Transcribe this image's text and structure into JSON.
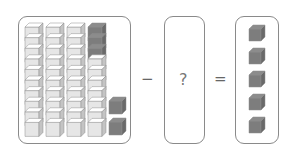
{
  "equation": {
    "minuend": {
      "tens_rods": 4,
      "cubes_per_rod": 10,
      "shaded_top_cubes_in_last_rod": 3,
      "ones_cubes": 2
    },
    "minus_sign": "−",
    "subtrahend": "?",
    "equals_sign": "=",
    "result": {
      "ones_cubes": 5
    }
  },
  "colors": {
    "light_cube": "#e6e6e6",
    "dark_cube": "#7d7d7d",
    "border": "#8a8a8a"
  }
}
